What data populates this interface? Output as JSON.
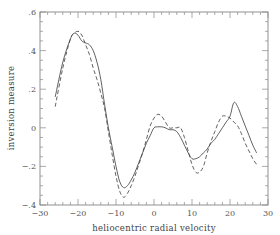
{
  "chart_data": {
    "type": "line",
    "title": "",
    "xlabel": "heliocentric radial velocity",
    "ylabel": "inversion measure",
    "xlim": [
      -30,
      30
    ],
    "ylim": [
      -0.4,
      0.6
    ],
    "xticks": [
      -30,
      -20,
      -10,
      0,
      10,
      20,
      30
    ],
    "xtick_labels": [
      "−30",
      "−20",
      "−10",
      "0",
      "10",
      "20",
      "30"
    ],
    "yticks": [
      -0.4,
      -0.2,
      0,
      0.2,
      0.4,
      0.6
    ],
    "ytick_labels": [
      "−.4",
      "−.2",
      "0",
      ".2",
      ".4",
      ".6"
    ],
    "grid": false,
    "legend": null,
    "series": [
      {
        "name": "solid",
        "style": "solid",
        "x": [
          -26,
          -24,
          -22,
          -21,
          -20,
          -19,
          -18,
          -17,
          -16,
          -15,
          -14,
          -13,
          -12,
          -11,
          -10,
          -9,
          -8,
          -7,
          -6,
          -5,
          -4,
          -3,
          -2,
          -1,
          0,
          1,
          2,
          3,
          4,
          5,
          6,
          7,
          8,
          9,
          10,
          11,
          12,
          13,
          14,
          15,
          16,
          17,
          18,
          19,
          20,
          21,
          22,
          23,
          24,
          25,
          26,
          27
        ],
        "values": [
          0.16,
          0.34,
          0.46,
          0.49,
          0.48,
          0.45,
          0.44,
          0.43,
          0.4,
          0.34,
          0.25,
          0.12,
          0.0,
          -0.1,
          -0.2,
          -0.28,
          -0.31,
          -0.3,
          -0.27,
          -0.23,
          -0.18,
          -0.13,
          -0.08,
          -0.04,
          0.0,
          0.005,
          0.005,
          0.0,
          -0.01,
          -0.01,
          -0.02,
          -0.05,
          -0.09,
          -0.13,
          -0.16,
          -0.16,
          -0.15,
          -0.13,
          -0.11,
          -0.08,
          -0.06,
          -0.03,
          0.0,
          0.03,
          0.06,
          0.13,
          0.11,
          0.06,
          0.01,
          -0.04,
          -0.09,
          -0.13
        ]
      },
      {
        "name": "dashed",
        "style": "dashed",
        "x": [
          -26,
          -24,
          -22,
          -21,
          -20,
          -19,
          -18,
          -17,
          -16,
          -15,
          -14,
          -13,
          -12,
          -11,
          -10,
          -9,
          -8,
          -7,
          -6,
          -5,
          -4,
          -3,
          -2,
          -1,
          0,
          1,
          2,
          3,
          4,
          5,
          6,
          7,
          8,
          9,
          10,
          11,
          12,
          13,
          14,
          15,
          16,
          17,
          18,
          19,
          20,
          21,
          22,
          23,
          24,
          25,
          26,
          27
        ],
        "values": [
          0.11,
          0.31,
          0.46,
          0.49,
          0.5,
          0.48,
          0.43,
          0.38,
          0.31,
          0.25,
          0.18,
          0.1,
          -0.02,
          -0.14,
          -0.25,
          -0.33,
          -0.36,
          -0.34,
          -0.3,
          -0.25,
          -0.19,
          -0.13,
          -0.06,
          0.01,
          0.05,
          0.07,
          0.06,
          0.03,
          0.0,
          0.0,
          0.0,
          0.0,
          -0.05,
          -0.12,
          -0.19,
          -0.23,
          -0.23,
          -0.2,
          -0.13,
          -0.07,
          -0.02,
          0.03,
          0.06,
          0.06,
          0.05,
          0.03,
          0.01,
          -0.03,
          -0.08,
          -0.12,
          -0.16,
          -0.19
        ]
      }
    ]
  }
}
